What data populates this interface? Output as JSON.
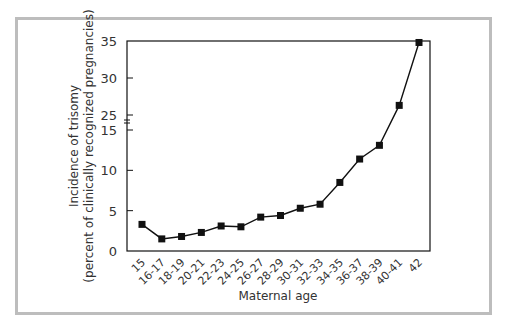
{
  "chart_data": {
    "type": "line",
    "title": "",
    "xlabel": "Maternal age",
    "ylabel_line1": "Incidence of trisomy",
    "ylabel_line2": "(percent of clinically recognized pregnancies)",
    "categories": [
      "15",
      "16-17",
      "18-19",
      "20-21",
      "22-23",
      "24-25",
      "26-27",
      "28-29",
      "30-31",
      "32-33",
      "34-35",
      "36-37",
      "38-39",
      "40-41",
      "42"
    ],
    "series": [
      {
        "name": "Incidence of trisomy",
        "values": [
          3.3,
          1.5,
          1.8,
          2.3,
          3.1,
          3.0,
          4.2,
          4.4,
          5.3,
          5.8,
          8.5,
          11.4,
          13.1,
          26.3,
          34.8
        ],
        "marker": "square",
        "color": "#111111"
      }
    ],
    "y_ticks": [
      "0",
      "5",
      "10",
      "15",
      "25",
      "30",
      "35"
    ],
    "y_axis_break": {
      "between": [
        15,
        25
      ]
    },
    "ylim": [
      0,
      35
    ],
    "grid": false,
    "legend": "none"
  },
  "colors": {
    "frame": "#bdbdbd",
    "line": "#111111",
    "axis": "#111111"
  }
}
